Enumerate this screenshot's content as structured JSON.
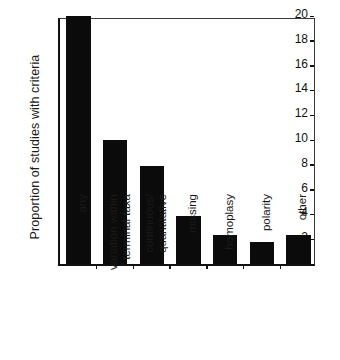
{
  "chart_data": {
    "type": "bar",
    "title": "",
    "xlabel": "",
    "ylabel": "Proportion of studies with criteria",
    "categories": [
      "any",
      "variation within terminal taxa",
      "continuous/ quantitative",
      "missing",
      "homoplasy",
      "polarity",
      "other"
    ],
    "category_lines": [
      [
        "any"
      ],
      [
        "variation within",
        "terminal taxa"
      ],
      [
        "continuous/",
        "quantitative"
      ],
      [
        "missing"
      ],
      [
        "homoplasy"
      ],
      [
        "polarity"
      ],
      [
        "other"
      ]
    ],
    "values": [
      20,
      10,
      7.9,
      3.85,
      2.3,
      1.75,
      2.35
    ],
    "ylim": [
      0,
      20
    ],
    "ytick_values": [
      0,
      2,
      4,
      6,
      8,
      10,
      12,
      14,
      16,
      18,
      20
    ],
    "ytick_labels": [
      "0",
      "2",
      "4",
      "6",
      "8",
      "10",
      "12",
      "14",
      "16",
      "18",
      "20"
    ],
    "grid": false,
    "legend": false,
    "bar_color": "#0b0b0b",
    "axis_color": "#111111",
    "background": "#ffffff"
  }
}
